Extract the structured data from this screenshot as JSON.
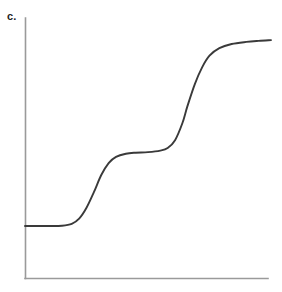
{
  "figure": {
    "panel_label": "c.",
    "background_color": "#ffffff",
    "width": 282,
    "height": 292
  },
  "axes": {
    "color": "#9a9a9a",
    "x_axis_name": "x-axis",
    "y_axis_name": "y-axis",
    "origin_px": [
      25,
      278
    ],
    "x_end_px": [
      268,
      278
    ],
    "y_top_px": [
      25,
      18
    ],
    "ticks": [],
    "tick_labels": []
  },
  "chart_data": {
    "type": "line",
    "title": "c.",
    "xlabel": "",
    "ylabel": "",
    "xlim": [
      0,
      1
    ],
    "ylim": [
      0,
      1
    ],
    "grid": false,
    "legend": null,
    "series": [
      {
        "name": "double-sigmoid-staircase",
        "color": "#3a3a3a",
        "description": "Two-step sigmoidal (staircase) curve rising from a low plateau through an intermediate plateau to a high plateau",
        "x": [
          0.0,
          0.05,
          0.1,
          0.15,
          0.19,
          0.22,
          0.25,
          0.28,
          0.31,
          0.34,
          0.37,
          0.41,
          0.45,
          0.5,
          0.55,
          0.58,
          0.61,
          0.64,
          0.66,
          0.69,
          0.72,
          0.75,
          0.79,
          0.84,
          0.9,
          0.95,
          1.0
        ],
        "y": [
          0.2,
          0.2,
          0.2,
          0.201,
          0.208,
          0.228,
          0.27,
          0.33,
          0.396,
          0.442,
          0.466,
          0.478,
          0.482,
          0.484,
          0.49,
          0.5,
          0.53,
          0.596,
          0.66,
          0.745,
          0.81,
          0.855,
          0.884,
          0.9,
          0.908,
          0.912,
          0.915
        ]
      }
    ],
    "plateaus": [
      {
        "name": "lower-plateau",
        "y_value": 0.2,
        "x_range": [
          0.0,
          0.19
        ]
      },
      {
        "name": "middle-plateau",
        "y_value": 0.482,
        "x_range": [
          0.41,
          0.58
        ]
      },
      {
        "name": "upper-plateau",
        "y_value": 0.912,
        "x_range": [
          0.84,
          1.0
        ]
      }
    ],
    "inflection_points": [
      {
        "name": "first-inflection",
        "x": 0.28,
        "y": 0.346
      },
      {
        "name": "second-inflection",
        "x": 0.687,
        "y": 0.704
      }
    ]
  }
}
